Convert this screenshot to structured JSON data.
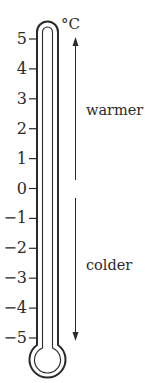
{
  "thermometer": {
    "unit": "°C",
    "ticks": [
      "5",
      "4",
      "3",
      "2",
      "1",
      "0",
      "−1",
      "−2",
      "−3",
      "−4",
      "−5"
    ],
    "warmer_label": "warmer",
    "colder_label": "colder"
  },
  "colors": {
    "stroke": "#2a2a2a",
    "background": "#ffffff"
  }
}
